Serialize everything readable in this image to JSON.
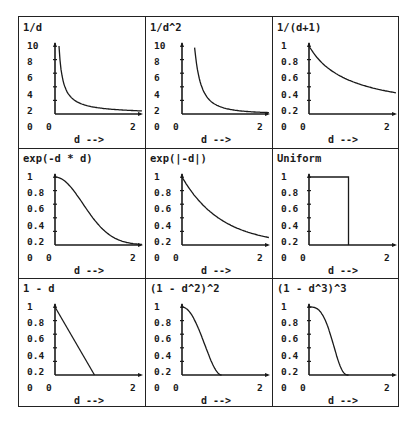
{
  "chart_data": [
    {
      "type": "line",
      "title": "1/d",
      "xlabel": "d -->",
      "ylabel": "",
      "xlim": [
        0,
        2.2
      ],
      "ylim": [
        0,
        10
      ],
      "x_ticks": [
        "0",
        "2"
      ],
      "y_ticks": [
        "10",
        "8",
        "6",
        "4",
        "2",
        "0"
      ],
      "x": [
        0.1,
        0.15,
        0.2,
        0.3,
        0.4,
        0.5,
        0.75,
        1.0,
        1.5,
        2.0,
        2.2
      ],
      "values": [
        10,
        6.67,
        5,
        3.33,
        2.5,
        2,
        1.33,
        1,
        0.67,
        0.5,
        0.45
      ]
    },
    {
      "type": "line",
      "title": "1/d^2",
      "xlabel": "d -->",
      "ylabel": "",
      "xlim": [
        0,
        2.2
      ],
      "ylim": [
        0,
        10
      ],
      "x_ticks": [
        "0",
        "2"
      ],
      "y_ticks": [
        "10",
        "8",
        "6",
        "4",
        "2",
        "0"
      ],
      "x": [
        0.32,
        0.4,
        0.5,
        0.6,
        0.75,
        1.0,
        1.25,
        1.5,
        2.0,
        2.2
      ],
      "values": [
        9.8,
        6.25,
        4,
        2.78,
        1.78,
        1,
        0.64,
        0.44,
        0.25,
        0.21
      ]
    },
    {
      "type": "line",
      "title": "1/(d+1)",
      "xlabel": "d -->",
      "ylabel": "",
      "xlim": [
        0,
        2.2
      ],
      "ylim": [
        0,
        1
      ],
      "x_ticks": [
        "0",
        "2"
      ],
      "y_ticks": [
        "1",
        "0.8",
        "0.6",
        "0.4",
        "0.2",
        "0"
      ],
      "x": [
        0,
        0.25,
        0.5,
        0.75,
        1.0,
        1.25,
        1.5,
        1.75,
        2.0,
        2.2
      ],
      "values": [
        1,
        0.8,
        0.67,
        0.57,
        0.5,
        0.44,
        0.4,
        0.36,
        0.33,
        0.31
      ]
    },
    {
      "type": "line",
      "title": "exp(-d * d)",
      "xlabel": "d -->",
      "ylabel": "",
      "xlim": [
        0,
        2.2
      ],
      "ylim": [
        0,
        1
      ],
      "x_ticks": [
        "0",
        "2"
      ],
      "y_ticks": [
        "1",
        "0.8",
        "0.6",
        "0.4",
        "0.2",
        "0"
      ],
      "x": [
        0,
        0.25,
        0.5,
        0.75,
        1.0,
        1.25,
        1.5,
        1.75,
        2.0,
        2.2
      ],
      "values": [
        1,
        0.94,
        0.78,
        0.57,
        0.37,
        0.21,
        0.11,
        0.05,
        0.02,
        0.01
      ]
    },
    {
      "type": "line",
      "title": "exp(|-d|)",
      "xlabel": "d -->",
      "ylabel": "",
      "xlim": [
        0,
        2.2
      ],
      "ylim": [
        0,
        1
      ],
      "x_ticks": [
        "0",
        "2"
      ],
      "y_ticks": [
        "1",
        "0.8",
        "0.6",
        "0.4",
        "0.2",
        "0"
      ],
      "x": [
        0,
        0.25,
        0.5,
        0.75,
        1.0,
        1.25,
        1.5,
        1.75,
        2.0,
        2.2
      ],
      "values": [
        1,
        0.78,
        0.61,
        0.47,
        0.37,
        0.29,
        0.22,
        0.17,
        0.14,
        0.11
      ]
    },
    {
      "type": "line",
      "title": "Uniform",
      "xlabel": "d -->",
      "ylabel": "",
      "xlim": [
        0,
        2.2
      ],
      "ylim": [
        0,
        1
      ],
      "x_ticks": [
        "0",
        "2"
      ],
      "y_ticks": [
        "1",
        "0.8",
        "0.6",
        "0.4",
        "0.2",
        "0"
      ],
      "x": [
        0,
        1,
        1
      ],
      "values": [
        1,
        1,
        0
      ]
    },
    {
      "type": "line",
      "title": "1 - d",
      "xlabel": "d -->",
      "ylabel": "",
      "xlim": [
        0,
        2.2
      ],
      "ylim": [
        0,
        1
      ],
      "x_ticks": [
        "0",
        "2"
      ],
      "y_ticks": [
        "1",
        "0.8",
        "0.6",
        "0.4",
        "0.2",
        "0"
      ],
      "x": [
        0,
        1
      ],
      "values": [
        1,
        0
      ]
    },
    {
      "type": "line",
      "title": "(1 - d^2)^2",
      "xlabel": "d -->",
      "ylabel": "",
      "xlim": [
        0,
        2.2
      ],
      "ylim": [
        0,
        1
      ],
      "x_ticks": [
        "0",
        "2"
      ],
      "y_ticks": [
        "1",
        "0.8",
        "0.6",
        "0.4",
        "0.2",
        "0"
      ],
      "x": [
        0,
        0.1,
        0.2,
        0.3,
        0.4,
        0.5,
        0.6,
        0.7,
        0.8,
        0.9,
        1.0
      ],
      "values": [
        1,
        0.98,
        0.92,
        0.83,
        0.71,
        0.56,
        0.41,
        0.26,
        0.13,
        0.04,
        0
      ]
    },
    {
      "type": "line",
      "title": "(1 - d^3)^3",
      "xlabel": "d -->",
      "ylabel": "",
      "xlim": [
        0,
        2.2
      ],
      "ylim": [
        0,
        1
      ],
      "x_ticks": [
        "0",
        "2"
      ],
      "y_ticks": [
        "1",
        "0.8",
        "0.6",
        "0.4",
        "0.2",
        "0"
      ],
      "x": [
        0,
        0.2,
        0.3,
        0.4,
        0.5,
        0.6,
        0.7,
        0.8,
        0.9,
        0.95,
        1.0
      ],
      "values": [
        1,
        0.98,
        0.92,
        0.82,
        0.67,
        0.48,
        0.28,
        0.11,
        0.02,
        0.003,
        0
      ]
    }
  ]
}
